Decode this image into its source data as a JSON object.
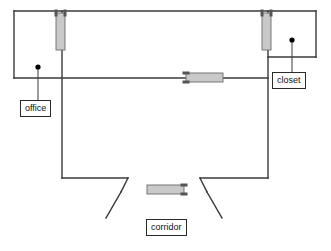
{
  "diagram": {
    "kind": "architectural-floor-plan",
    "canvas": {
      "width": 331,
      "height": 251
    },
    "colors": {
      "wall": "#3a3a3a",
      "door_fill": "#c9c9c9",
      "door_stroke": "#6b6b6b",
      "hinge": "#555555",
      "leader": "#3a3a3a",
      "marker_dot": "#000000",
      "label_text": "#111111",
      "label_border": "#2b2b2b",
      "background": "#ffffff"
    }
  },
  "labels": [
    {
      "id": "office",
      "text": "office",
      "box": {
        "x": 20,
        "y": 100,
        "w": 36,
        "h": 15
      },
      "marker": {
        "x": 38,
        "y": 67
      },
      "leader": {
        "x1": 38,
        "y1": 67,
        "x2": 38,
        "y2": 100
      }
    },
    {
      "id": "closet",
      "text": "closet",
      "box": {
        "x": 272,
        "y": 72,
        "w": 40,
        "h": 15
      },
      "marker": {
        "x": 292,
        "y": 40
      },
      "leader": {
        "x1": 292,
        "y1": 40,
        "x2": 292,
        "y2": 72
      }
    },
    {
      "id": "corridor",
      "text": "corridor",
      "box": {
        "x": 146,
        "y": 219,
        "w": 44,
        "h": 15
      },
      "marker": null,
      "leader": null
    }
  ],
  "walls": {
    "segments": [
      {
        "id": "outer-top",
        "x1": 14,
        "y1": 11,
        "x2": 316,
        "y2": 11
      },
      {
        "id": "outer-left-upper",
        "x1": 14,
        "y1": 11,
        "x2": 14,
        "y2": 78
      },
      {
        "id": "office-bottom",
        "x1": 14,
        "y1": 78,
        "x2": 268,
        "y2": 78
      },
      {
        "id": "closet-right",
        "x1": 316,
        "y1": 11,
        "x2": 316,
        "y2": 57
      },
      {
        "id": "closet-bottom",
        "x1": 268,
        "y1": 57,
        "x2": 316,
        "y2": 57
      },
      {
        "id": "center-partition-left",
        "x1": 62,
        "y1": 11,
        "x2": 62,
        "y2": 178
      },
      {
        "id": "center-partition-right",
        "x1": 268,
        "y1": 11,
        "x2": 268,
        "y2": 178
      },
      {
        "id": "hall-bottom-left",
        "x1": 62,
        "y1": 178,
        "x2": 128,
        "y2": 178
      },
      {
        "id": "hall-bottom-right",
        "x1": 200,
        "y1": 178,
        "x2": 268,
        "y2": 178
      },
      {
        "id": "corridor-splay-left",
        "x1": 128,
        "y1": 178,
        "x2": 121,
        "y2": 192
      },
      {
        "id": "corridor-splay-right",
        "x1": 200,
        "y1": 178,
        "x2": 207,
        "y2": 192
      },
      {
        "id": "corridor-leg-left",
        "x1": 121,
        "y1": 192,
        "x2": 106,
        "y2": 218
      },
      {
        "id": "corridor-leg-right",
        "x1": 207,
        "y1": 192,
        "x2": 222,
        "y2": 218
      }
    ]
  },
  "doors": [
    {
      "id": "door-office-north",
      "orientation": "vertical",
      "panel": {
        "x": 56,
        "y": 13,
        "w": 9,
        "h": 37
      },
      "hinges": [
        {
          "x": 56,
          "y": 13
        },
        {
          "x": 65,
          "y": 13
        }
      ]
    },
    {
      "id": "door-closet-north",
      "orientation": "vertical",
      "panel": {
        "x": 262,
        "y": 13,
        "w": 9,
        "h": 37
      },
      "hinges": [
        {
          "x": 262,
          "y": 13
        },
        {
          "x": 271,
          "y": 13
        }
      ]
    },
    {
      "id": "door-office-south",
      "orientation": "horizontal",
      "panel": {
        "x": 186,
        "y": 73,
        "w": 37,
        "h": 9
      },
      "hinges": [
        {
          "x": 186,
          "y": 73
        },
        {
          "x": 186,
          "y": 82
        }
      ]
    },
    {
      "id": "door-corridor",
      "orientation": "horizontal",
      "panel": {
        "x": 147,
        "y": 185,
        "w": 37,
        "h": 9
      },
      "hinges": [
        {
          "x": 184,
          "y": 185
        },
        {
          "x": 184,
          "y": 194
        }
      ]
    }
  ]
}
